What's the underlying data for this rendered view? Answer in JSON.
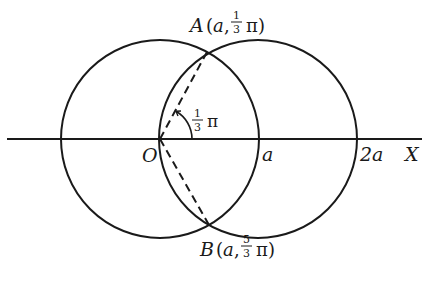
{
  "figure": {
    "type": "polar-coordinate-diagram",
    "colors": {
      "stroke": "#1a1a1a",
      "background": "#ffffff"
    },
    "geometry": {
      "origin": {
        "x": 160,
        "y": 139
      },
      "radius_px": 99,
      "circle_left_center": {
        "x": 160,
        "y": 139
      },
      "circle_right_center": {
        "x": 258,
        "y": 139
      },
      "axis": {
        "x1": 7,
        "x2": 422,
        "y": 139
      },
      "point_A": {
        "x": 207,
        "y": 52
      },
      "point_B": {
        "x": 209,
        "y": 225
      },
      "angle_arc_radius": 32
    }
  },
  "labels": {
    "A": {
      "name": "A",
      "open": "(",
      "coord_r": "a",
      "comma": ",",
      "frac_num": "1",
      "frac_den": "3",
      "pi": "π",
      "close": ")"
    },
    "B": {
      "name": "B",
      "open": "(",
      "coord_r": "a",
      "comma": ",",
      "frac_num": "5",
      "frac_den": "3",
      "pi": "π",
      "close": ")"
    },
    "angle": {
      "frac_num": "1",
      "frac_den": "3",
      "pi": "π"
    },
    "origin": "O",
    "a_mark": "a",
    "two_a_mark": "2a",
    "axis_name": "X"
  }
}
